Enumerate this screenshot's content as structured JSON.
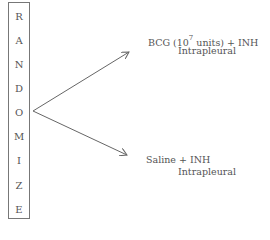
{
  "randomize_box": {
    "letters": [
      "R",
      "A",
      "N",
      "D",
      "O",
      "M",
      "I",
      "Z",
      "E"
    ]
  },
  "arms": [
    {
      "line1_prefix": "BCG (10",
      "line1_exp": "7",
      "line1_suffix": " units) + INH",
      "line2": "Intrapleural"
    },
    {
      "line1": "Saline + INH",
      "line2": "Intrapleural"
    }
  ]
}
